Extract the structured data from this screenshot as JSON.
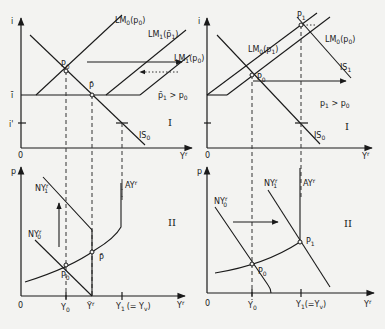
{
  "panels": {
    "top_left": {
      "y_axis": "i",
      "x_axis": "Y",
      "x_axis_sup": "r",
      "origin": "0",
      "i_bar": "ī",
      "i_prime": "i'",
      "lm0": "LM",
      "lm0_sub": "0",
      "lm0_arg": "(p",
      "lm0_arg_sub": "0",
      "lm0_close": ")",
      "lm1bar": "LM",
      "lm1bar_sub": "1",
      "lm1bar_arg": "(p̄",
      "lm1bar_arg_sub": "1",
      "lm1bar_close": ")",
      "lm1p0": "LM",
      "lm1p0_sub": "1",
      "lm1p0_arg": "(p",
      "lm1p0_arg_sub": "0",
      "lm1p0_close": ")",
      "is0": "IS",
      "is0_sub": "0",
      "sup_r": "r",
      "point_p0": "P",
      "point_p0_sub": "0",
      "point_pbar": "P̄",
      "condition": "p̄",
      "condition_sub": "1",
      "condition_rest": " > p",
      "condition_rest_sub": "0",
      "quadrant": "I"
    },
    "top_right": {
      "y_axis": "i",
      "x_axis": "Y",
      "x_axis_sup": "r",
      "origin": "0",
      "lm0p1": "LM",
      "lm0p1_sub": "0",
      "lm0p1_arg": "(p",
      "lm0p1_arg_sub": "1",
      "lm0p1_close": ")",
      "lm0p0": "LM",
      "lm0p0_sub": "0",
      "lm0p0_arg": "(p",
      "lm0p0_arg_sub": "0",
      "lm0p0_close": ")",
      "is1": "IS",
      "is1_sub": "1",
      "is0": "IS",
      "is0_sub": "0",
      "sup_r": "r",
      "point_p0": "P",
      "point_p0_sub": "0",
      "point_p1": "P",
      "point_p1_sub": "1",
      "condition": "p",
      "condition_sub": "1",
      "condition_rest": " > p",
      "condition_rest_sub": "0",
      "quadrant": "I"
    },
    "bottom_left": {
      "y_axis": "p",
      "x_axis": "Y",
      "x_axis_sup": "r",
      "origin": "0",
      "ny1": "NY",
      "ny1_sub": "1",
      "ny0": "NY",
      "ny0_sub": "0",
      "ay": "AY",
      "sup_r": "r",
      "point_p0": "P",
      "point_p0_sub": "0",
      "point_pbar": "P̄",
      "tick_y0": "Y",
      "tick_y0_sub": "0",
      "tick_ybar": "Ȳ",
      "tick_y1": "Y",
      "tick_y1_sub": "1",
      "tick_y1_paren": "(= Y",
      "tick_y1_paren_sub": "v",
      "tick_y1_close": ")",
      "quadrant": "II"
    },
    "bottom_right": {
      "y_axis": "p",
      "x_axis": "Y",
      "x_axis_sup": "r",
      "origin": "0",
      "ny1": "NY",
      "ny1_sub": "1",
      "ny0": "NY",
      "ny0_sub": "0",
      "ay": "AY",
      "sup_r": "r",
      "point_p0": "P",
      "point_p0_sub": "0",
      "point_p1": "P",
      "point_p1_sub": "1",
      "tick_y0": "Y",
      "tick_y0_sub": "0",
      "tick_y1": "Y",
      "tick_y1_sub": "1",
      "tick_y1_paren": "(=Y",
      "tick_y1_paren_sub": "v",
      "tick_y1_close": ")",
      "quadrant": "II"
    }
  }
}
